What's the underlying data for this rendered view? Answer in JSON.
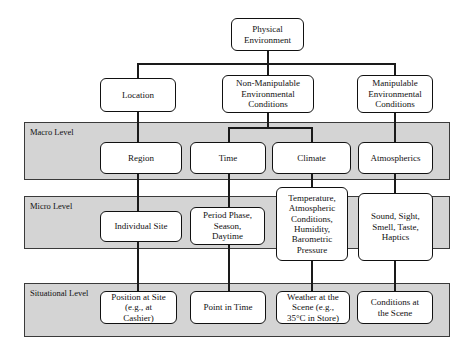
{
  "diagram": {
    "bands": [
      {
        "id": "macro",
        "label": "Macro Level"
      },
      {
        "id": "micro",
        "label": "Micro Level"
      },
      {
        "id": "situational",
        "label": "Situational Level"
      }
    ],
    "nodes": {
      "root": {
        "label": "Physical\nEnvironment"
      },
      "location": {
        "label": "Location"
      },
      "non_manipulable": {
        "label": "Non-Manipulable\nEnvironmental\nConditions"
      },
      "manipulable": {
        "label": "Manipulable\nEnvironmental\nConditions"
      },
      "region": {
        "label": "Region"
      },
      "time": {
        "label": "Time"
      },
      "climate": {
        "label": "Climate"
      },
      "atmospherics": {
        "label": "Atmospherics"
      },
      "individual_site": {
        "label": "Individual Site"
      },
      "period_phase": {
        "label": "Period Phase,\nSeason,\nDaytime"
      },
      "temperature": {
        "label": "Temperature,\nAtmospheric\nConditions,\nHumidity,\nBarometric\nPressure"
      },
      "senses": {
        "label": "Sound, Sight,\nSmell, Taste,\nHaptics"
      },
      "position_at_site": {
        "label": "Position at Site\n(e.g., at\nCashier)"
      },
      "point_in_time": {
        "label": "Point in Time"
      },
      "weather_scene": {
        "label": "Weather at the\nScene (e.g.,\n35°C in Store)"
      },
      "conditions_scene": {
        "label": "Conditions at\nthe Scene"
      }
    },
    "colors": {
      "band_fill": "#d4d4d4",
      "band_border": "#3a3a3a",
      "box_fill": "#ffffff",
      "box_border": "#111111",
      "connector": "#1a1a1a",
      "page_background": "#ffffff"
    }
  }
}
